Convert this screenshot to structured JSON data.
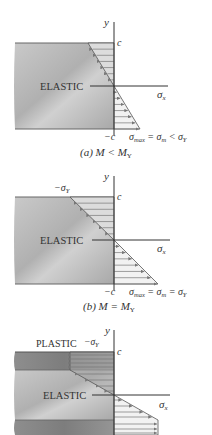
{
  "panels": [
    {
      "id": "a",
      "caption": "(a) M < M",
      "caption_sub": "Y",
      "zone_labels": [
        "ELASTIC"
      ],
      "top_label": "c",
      "bottom_label": "−c",
      "y_axis": "y",
      "x_axis": "σ",
      "x_axis_sub": "x",
      "stress_label": "σmax = σm < σY",
      "stress_main": "σ",
      "stress_sub1": "max",
      "stress_mid": " = σ",
      "stress_sub2": "m",
      "stress_end": " < σ",
      "stress_sub3": "Y",
      "relation": "M < M_Y"
    },
    {
      "id": "b",
      "caption": "(b) M = M",
      "caption_sub": "Y",
      "zone_labels": [
        "ELASTIC"
      ],
      "top_stress_label": "−σ",
      "top_stress_sub": "Y",
      "top_label": "c",
      "bottom_label": "−c",
      "y_axis": "y",
      "x_axis": "σ",
      "x_axis_sub": "x",
      "stress_main": "σ",
      "stress_sub1": "max",
      "stress_mid": " = σ",
      "stress_sub2": "m",
      "stress_end": " = σ",
      "stress_sub3": "Y",
      "relation": "M = M_Y"
    },
    {
      "id": "c",
      "zone_labels": [
        "PLASTIC",
        "ELASTIC"
      ],
      "top_stress_label": "−σ",
      "top_stress_sub": "Y",
      "top_label": "c",
      "y_axis": "y",
      "x_axis": "σ",
      "x_axis_sub": "x"
    }
  ],
  "colors": {
    "beam_gray": "#b8b8b8",
    "beam_dark": "#8c8c8c",
    "hatch_fill": "#d6d6d6",
    "line": "#444444",
    "arrow": "#7a7a7a"
  }
}
